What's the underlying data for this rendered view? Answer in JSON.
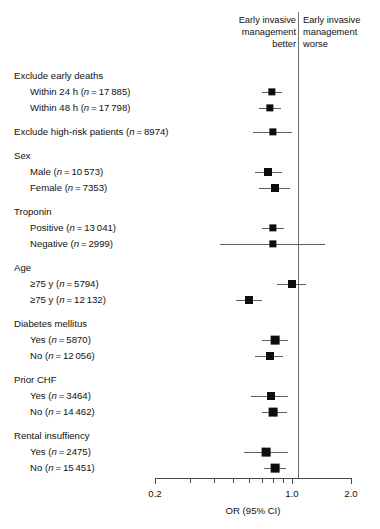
{
  "figure": {
    "type": "forest-plot",
    "axis_title": "OR (95% CI)"
  },
  "headers": {
    "left": "Early invasive\nmanagement\nbetter",
    "right": "Early invasive\nmanagement\nworse"
  },
  "axis": {
    "scale": "log",
    "min": 0.2,
    "max": 2.0,
    "null_value": 1.0,
    "tick_values": [
      0.2,
      0.3,
      0.4,
      0.5,
      0.6,
      0.7,
      0.8,
      0.9,
      1.0,
      2.0
    ],
    "labeled_ticks": [
      {
        "value": 0.2,
        "label": "0.2"
      },
      {
        "value": 1.0,
        "label": "1.0"
      },
      {
        "value": 2.0,
        "label": "2.0"
      }
    ]
  },
  "chart_data": {
    "type": "scatter",
    "title": "",
    "xlabel": "OR (95% CI)",
    "ylabel": "",
    "xscale": "log",
    "xlim": [
      0.2,
      2.0
    ],
    "reference_line": 1.0,
    "grid": false,
    "legend": "none",
    "annotations": [
      "Early invasive management better",
      "Early invasive management worse"
    ],
    "rows": [
      {
        "kind": "heading",
        "label": "Exclude early deaths"
      },
      {
        "kind": "data",
        "label": "Within 24 h (n = 17 885)",
        "name": "Within 24 h",
        "n": "17 885",
        "or": 0.79,
        "ci_low": 0.7,
        "ci_high": 0.89,
        "weight": 3
      },
      {
        "kind": "data",
        "label": "Within 48 h (n = 17 798)",
        "name": "Within 48 h",
        "n": "17 798",
        "or": 0.77,
        "ci_low": 0.68,
        "ci_high": 0.88,
        "weight": 3
      },
      {
        "kind": "gap"
      },
      {
        "kind": "data",
        "label": "Exclude high-risk patients (n = 8974)",
        "name": "Exclude high-risk patients",
        "n": "8974",
        "or": 0.8,
        "ci_low": 0.63,
        "ci_high": 1.0,
        "weight": 3,
        "heading_level": true
      },
      {
        "kind": "gap"
      },
      {
        "kind": "heading",
        "label": "Sex"
      },
      {
        "kind": "data",
        "label": "Male (n = 10 573)",
        "name": "Male",
        "n": "10 573",
        "or": 0.75,
        "ci_low": 0.65,
        "ci_high": 0.89,
        "weight": 4
      },
      {
        "kind": "data",
        "label": "Female (n = 7353)",
        "name": "Female",
        "n": "7353",
        "or": 0.82,
        "ci_low": 0.68,
        "ci_high": 0.98,
        "weight": 4
      },
      {
        "kind": "gap"
      },
      {
        "kind": "heading",
        "label": "Troponin"
      },
      {
        "kind": "data",
        "label": "Positive (n = 13 041)",
        "name": "Positive",
        "n": "13 041",
        "or": 0.8,
        "ci_low": 0.7,
        "ci_high": 0.91,
        "weight": 3
      },
      {
        "kind": "data",
        "label": "Negative (n = 2999)",
        "name": "Negative",
        "n": "2999",
        "or": 0.8,
        "ci_low": 0.43,
        "ci_high": 1.48,
        "weight": 3
      },
      {
        "kind": "gap"
      },
      {
        "kind": "heading",
        "label": "Age"
      },
      {
        "kind": "data",
        "label": "≥75 y (n = 5794)",
        "name": "Age group 1",
        "n": "5794",
        "or": 1.0,
        "ci_low": 0.84,
        "ci_high": 1.18,
        "weight": 4
      },
      {
        "kind": "data",
        "label": "≥75 y (n = 12 132)",
        "name": "Age group 2",
        "n": "12 132",
        "or": 0.6,
        "ci_low": 0.52,
        "ci_high": 0.7,
        "weight": 4
      },
      {
        "kind": "gap"
      },
      {
        "kind": "heading",
        "label": "Diabetes mellitus"
      },
      {
        "kind": "data",
        "label": "Yes (n = 5870)",
        "name": "Diabetes yes",
        "n": "5870",
        "or": 0.82,
        "ci_low": 0.7,
        "ci_high": 0.95,
        "weight": 5
      },
      {
        "kind": "data",
        "label": "No (n = 12 056)",
        "name": "Diabetes no",
        "n": "12 056",
        "or": 0.77,
        "ci_low": 0.65,
        "ci_high": 0.9,
        "weight": 4
      },
      {
        "kind": "gap"
      },
      {
        "kind": "heading",
        "label": "Prior CHF"
      },
      {
        "kind": "data",
        "label": "Yes (n = 3464)",
        "name": "Prior CHF yes",
        "n": "3464",
        "or": 0.78,
        "ci_low": 0.62,
        "ci_high": 0.95,
        "weight": 4
      },
      {
        "kind": "data",
        "label": "No (n = 14 462)",
        "name": "Prior CHF no",
        "n": "14 462",
        "or": 0.8,
        "ci_low": 0.7,
        "ci_high": 0.94,
        "weight": 5
      },
      {
        "kind": "gap"
      },
      {
        "kind": "heading",
        "label": "Rental insuffiency"
      },
      {
        "kind": "data",
        "label": "Yes (n = 2475)",
        "name": "Renal insufficiency yes",
        "n": "2475",
        "or": 0.74,
        "ci_low": 0.57,
        "ci_high": 0.95,
        "weight": 5
      },
      {
        "kind": "data",
        "label": "No (n = 15 451)",
        "name": "Renal insufficiency no",
        "n": "15 451",
        "or": 0.82,
        "ci_low": 0.72,
        "ci_high": 0.93,
        "weight": 5
      }
    ]
  }
}
